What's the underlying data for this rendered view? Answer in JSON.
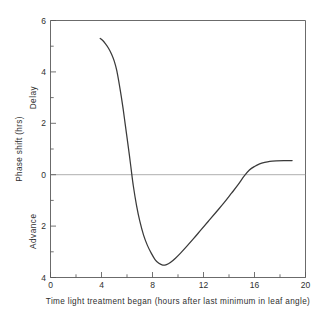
{
  "chart_data": {
    "type": "line",
    "title": "",
    "xlabel": "Time light treatment began (hours after last minimum in leaf angle)",
    "ylabel": "Phase shift (hrs)",
    "xlim": [
      0,
      20
    ],
    "ylim": [
      -4,
      6
    ],
    "grid": false,
    "legend": null,
    "y_axis_note": "Positive values are plotted upward and denote Delay; negative values are plotted downward and denote Advance. Tick labels show absolute magnitude.",
    "xticks": [
      0,
      4,
      8,
      12,
      16,
      20
    ],
    "xtick_labels": [
      "0",
      "4",
      "8",
      "12",
      "16",
      "20"
    ],
    "xticks_minor": [
      2,
      6,
      10,
      14,
      18
    ],
    "yticks": [
      6,
      4,
      2,
      0,
      -2,
      -4
    ],
    "ytick_labels": [
      "6",
      "4",
      "2",
      "0",
      "2",
      "4"
    ],
    "yticks_minor": [
      5,
      3,
      1,
      -1,
      -3
    ],
    "region_labels": [
      {
        "text": "Delay",
        "y_center": 3.0
      },
      {
        "text": "Advance",
        "y_center": -2.2
      }
    ],
    "annotations": [
      {
        "text": "zero phase-shift reference line",
        "y": 0
      }
    ],
    "series": [
      {
        "name": "Phase response curve",
        "color": "#3a3a3a",
        "x": [
          3.9,
          4.1,
          4.3,
          4.55,
          4.8,
          5.0,
          5.2,
          5.4,
          5.55,
          5.7,
          5.85,
          6.0,
          6.15,
          6.3,
          6.5,
          6.75,
          7.0,
          7.3,
          7.6,
          7.9,
          8.2,
          8.5,
          8.8,
          9.1,
          9.4,
          9.8,
          10.2,
          10.7,
          11.2,
          11.8,
          12.4,
          13.0,
          13.6,
          14.2,
          14.7,
          15.2,
          15.6,
          16.0,
          16.4,
          16.8,
          17.2,
          17.7,
          18.3,
          18.95
        ],
        "y": [
          5.3,
          5.22,
          5.1,
          4.92,
          4.68,
          4.42,
          4.05,
          3.5,
          3.05,
          2.55,
          2.0,
          1.45,
          0.9,
          0.32,
          -0.45,
          -1.2,
          -1.8,
          -2.35,
          -2.75,
          -3.05,
          -3.3,
          -3.45,
          -3.52,
          -3.5,
          -3.42,
          -3.25,
          -3.05,
          -2.78,
          -2.5,
          -2.15,
          -1.8,
          -1.45,
          -1.1,
          -0.72,
          -0.4,
          -0.05,
          0.18,
          0.32,
          0.42,
          0.48,
          0.52,
          0.54,
          0.55,
          0.55
        ]
      }
    ],
    "key_features": {
      "curve_start_x": 3.9,
      "curve_start_y_delay": 5.3,
      "first_zero_crossing_x": 6.3,
      "minimum_x": 8.8,
      "minimum_y_advance": 3.52,
      "second_zero_crossing_x": 15.25,
      "plateau_y_delay": 0.55,
      "curve_end_x": 18.95
    }
  }
}
